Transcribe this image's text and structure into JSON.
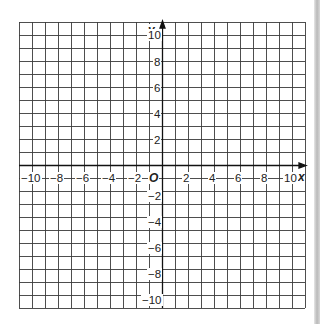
{
  "figure": {
    "type": "coordinate-grid",
    "x_axis": {
      "name": "x",
      "min": -11,
      "max": 11,
      "tick_labels": [
        "-10",
        "-8",
        "-6",
        "-4",
        "-2",
        "2",
        "4",
        "6",
        "8",
        "10"
      ],
      "tick_values": [
        -10,
        -8,
        -6,
        -4,
        -2,
        2,
        4,
        6,
        8,
        10
      ]
    },
    "y_axis": {
      "name": "y",
      "min": -11,
      "max": 11,
      "tick_labels": [
        "10",
        "8",
        "6",
        "4",
        "2",
        "-2",
        "-4",
        "-6",
        "-8",
        "-10"
      ],
      "tick_values": [
        10,
        8,
        6,
        4,
        2,
        -2,
        -4,
        -6,
        -8,
        -10
      ]
    },
    "origin_label": "O",
    "grid_step": 1,
    "colors": {
      "grid": "#3a3a3a",
      "axis": "#111111",
      "text": "#222222",
      "background": "#ffffff"
    }
  },
  "labels": {
    "x_name": "x",
    "y_name": "y",
    "origin": "O",
    "x": [
      "−10",
      "−8",
      "−6",
      "−4",
      "−2",
      "2",
      "4",
      "6",
      "8",
      "10"
    ],
    "y": [
      "10",
      "8",
      "6",
      "4",
      "2",
      "−2",
      "−4",
      "−6",
      "−8",
      "−10"
    ]
  }
}
